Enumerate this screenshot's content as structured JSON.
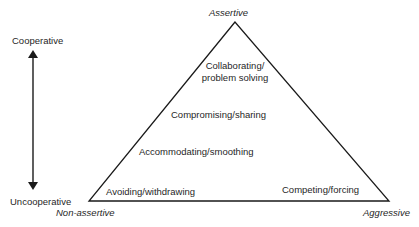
{
  "diagram": {
    "type": "conflict-styles-triangle",
    "axis": {
      "top_label": "Cooperative",
      "bottom_label": "Uncooperative"
    },
    "vertices": {
      "apex": "Assertive",
      "bottom_left": "Non-assertive",
      "bottom_right": "Aggressive"
    },
    "styles": [
      {
        "line1": "Collaborating/",
        "line2": "problem solving"
      },
      {
        "line1": "Compromising/sharing"
      },
      {
        "line1": "Accommodating/smoothing"
      },
      {
        "line1": "Avoiding/withdrawing"
      },
      {
        "line1": "Competing/forcing"
      }
    ],
    "colors": {
      "line": "#1a1a1a",
      "text": "#1f1f1f",
      "background": "#ffffff"
    }
  }
}
